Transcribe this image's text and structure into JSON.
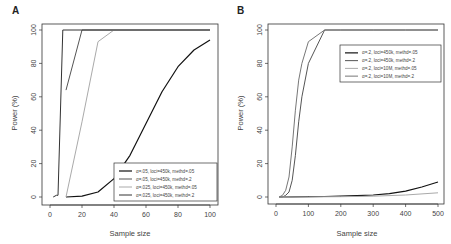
{
  "chart_data": [
    {
      "panel": "A",
      "type": "line",
      "title": "",
      "xlabel": "Sample size",
      "ylabel": "Power (%)",
      "xlim": [
        0,
        100
      ],
      "ylim": [
        0,
        100
      ],
      "xticks": [
        0,
        20,
        40,
        60,
        80,
        100
      ],
      "yticks": [
        0,
        20,
        40,
        60,
        80,
        100
      ],
      "grid": false,
      "legend_position": "bottom-right",
      "series": [
        {
          "name": "α=.05, loci=450k, methd=.05",
          "color": "#111111",
          "width": 1.2,
          "x": [
            10,
            20,
            30,
            40,
            50,
            60,
            70,
            80,
            90,
            100
          ],
          "y": [
            0,
            0.5,
            3,
            11,
            25,
            44,
            63,
            78,
            88,
            94
          ]
        },
        {
          "name": "α=.05, loci=450k, methd=.2",
          "color": "#555555",
          "width": 1.0,
          "x": [
            10,
            20,
            30,
            40,
            50,
            60,
            70,
            80,
            90,
            100
          ],
          "y": [
            64,
            100,
            100,
            100,
            100,
            100,
            100,
            100,
            100,
            100
          ]
        },
        {
          "name": "α=.025, loci=450k, methd=.05",
          "color": "#aaaaaa",
          "width": 1.0,
          "x": [
            10,
            20,
            30,
            40,
            50,
            60,
            70,
            80,
            90,
            100
          ],
          "y": [
            0,
            45,
            93,
            100,
            100,
            100,
            100,
            100,
            100,
            100
          ]
        },
        {
          "name": "α=.025, loci=450k, methd=.2",
          "color": "#333333",
          "width": 1.0,
          "x": [
            2,
            4,
            5,
            8,
            10,
            20,
            40,
            60,
            80,
            100
          ],
          "y": [
            0,
            1,
            1,
            100,
            100,
            100,
            100,
            100,
            100,
            100
          ]
        }
      ]
    },
    {
      "panel": "B",
      "type": "line",
      "title": "",
      "xlabel": "Sample size",
      "ylabel": "Power (%)",
      "xlim": [
        0,
        500
      ],
      "ylim": [
        0,
        100
      ],
      "xticks": [
        0,
        100,
        200,
        300,
        400,
        500
      ],
      "yticks": [
        0,
        20,
        40,
        60,
        80,
        100
      ],
      "grid": false,
      "legend_position": "top-right",
      "series": [
        {
          "name": "α=.2, loci=450k, methd=.05",
          "color": "#111111",
          "width": 1.2,
          "x": [
            10,
            50,
            100,
            150,
            200,
            250,
            300,
            350,
            400,
            450,
            500
          ],
          "y": [
            0,
            0.1,
            0.2,
            0.3,
            0.5,
            0.8,
            1.2,
            2,
            3.5,
            6,
            9
          ]
        },
        {
          "name": "α=.2, loci=450k, methd=.2",
          "color": "#555555",
          "width": 1.0,
          "x": [
            10,
            20,
            30,
            40,
            50,
            60,
            70,
            80,
            100,
            150,
            200,
            300,
            400,
            500
          ],
          "y": [
            0,
            0,
            1,
            3,
            10,
            25,
            45,
            60,
            80,
            100,
            100,
            100,
            100,
            100
          ]
        },
        {
          "name": "α=.2, loci=10M, methd=.05",
          "color": "#aaaaaa",
          "width": 1.0,
          "x": [
            10,
            100,
            200,
            300,
            400,
            500
          ],
          "y": [
            0,
            0.05,
            0.2,
            0.5,
            1.2,
            2.5
          ]
        },
        {
          "name": "α=.2, loci=10M, methd=.2",
          "color": "#777777",
          "width": 1.0,
          "x": [
            10,
            20,
            30,
            40,
            50,
            60,
            70,
            80,
            100,
            150,
            200,
            300,
            400,
            500
          ],
          "y": [
            0,
            1,
            4,
            12,
            30,
            52,
            70,
            80,
            93,
            100,
            100,
            100,
            100,
            100
          ]
        }
      ]
    }
  ],
  "layout": [
    {
      "frame": {
        "x": 42,
        "y": 24,
        "w": 176,
        "h": 181
      },
      "xmap": [
        50,
        210
      ],
      "ymap": [
        197,
        30
      ],
      "legend": {
        "x": 114,
        "y": 163,
        "w": 103,
        "h": 38
      },
      "panel_label_pos": [
        12,
        14
      ],
      "xlabel_pos": [
        130,
        236
      ],
      "ylabel_pos": [
        17,
        113
      ]
    },
    {
      "frame": {
        "x": 268,
        "y": 24,
        "w": 176,
        "h": 180
      },
      "xmap": [
        276,
        438
      ],
      "ymap": [
        197,
        30
      ],
      "legend": {
        "x": 340,
        "y": 45,
        "w": 101,
        "h": 37
      },
      "panel_label_pos": [
        237,
        14
      ],
      "xlabel_pos": [
        357,
        236
      ],
      "ylabel_pos": [
        243,
        113
      ]
    }
  ]
}
